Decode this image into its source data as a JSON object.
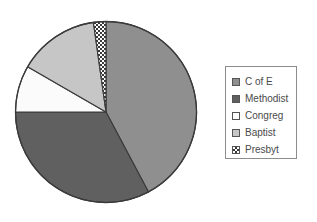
{
  "chart_data": {
    "type": "pie",
    "title": "",
    "subtitle": "",
    "categories": [
      "C of E",
      "Methodist",
      "Congreg",
      "Baptist",
      "Presbyt"
    ],
    "values": [
      152,
      118,
      30,
      52,
      8
    ],
    "value_unit": "degrees",
    "percentages": [
      42.2,
      32.8,
      8.3,
      14.4,
      2.2
    ],
    "start_angle_deg": 0,
    "direction": "clockwise",
    "legend_position": "right",
    "grid": false,
    "slices": [
      {
        "label": "C of E",
        "angle_deg": 152,
        "percent": 42.2,
        "fill": "#8f8f8f",
        "pattern": "solid",
        "start_deg": 0,
        "end_deg": 152
      },
      {
        "label": "Methodist",
        "angle_deg": 118,
        "percent": 32.8,
        "fill": "#606060",
        "pattern": "solid",
        "start_deg": 152,
        "end_deg": 270
      },
      {
        "label": "Congreg",
        "angle_deg": 30,
        "percent": 8.3,
        "fill": "#fbfbfb",
        "pattern": "solid",
        "start_deg": 270,
        "end_deg": 300
      },
      {
        "label": "Baptist",
        "angle_deg": 52,
        "percent": 14.4,
        "fill": "#c6c6c6",
        "pattern": "solid",
        "start_deg": 300,
        "end_deg": 352
      },
      {
        "label": "Presbyt",
        "angle_deg": 8,
        "percent": 2.2,
        "fill": "#ffffff",
        "pattern": "checkered",
        "start_deg": 352,
        "end_deg": 360
      }
    ],
    "xlabel": "",
    "ylabel": ""
  },
  "legend": {
    "items": [
      {
        "label": "C of E",
        "swatch": "swatch-medium-gray",
        "color": "#8f8f8f"
      },
      {
        "label": "Methodist",
        "swatch": "swatch-dark-gray",
        "color": "#606060"
      },
      {
        "label": "Congreg",
        "swatch": "swatch-white",
        "color": "#ffffff"
      },
      {
        "label": "Baptist",
        "swatch": "swatch-light-gray",
        "color": "#c6c6c6"
      },
      {
        "label": "Presbyt",
        "swatch": "swatch-checkered",
        "color": "#ffffff"
      }
    ]
  },
  "style": {
    "outline_color": "#3a3a3a",
    "legend_border_color": "#8d8d8d",
    "text_color": "#4a4a4a",
    "background": "#ffffff"
  }
}
